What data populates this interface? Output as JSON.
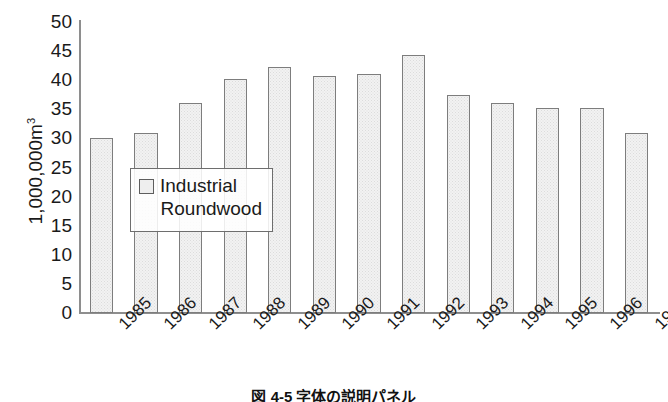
{
  "chart_data": {
    "type": "bar",
    "title": "",
    "xlabel": "",
    "ylabel": "1,000,000m3",
    "ylabel_base": "1,000,000m",
    "ylabel_sup": "3",
    "ylim": [
      0,
      50
    ],
    "ytick_step": 5,
    "grid": false,
    "legend_position": "inside-left",
    "categories": [
      "1985",
      "1986",
      "1987",
      "1988",
      "1989",
      "1990",
      "1991",
      "1992",
      "1993",
      "1994",
      "1995",
      "1996",
      "1997"
    ],
    "yticks": [
      "50",
      "45",
      "40",
      "35",
      "30",
      "25",
      "20",
      "15",
      "10",
      "5",
      "0"
    ],
    "ytick_values": [
      50,
      45,
      40,
      35,
      30,
      25,
      20,
      15,
      10,
      5,
      0
    ],
    "series": [
      {
        "name": "Industrial Roundwood",
        "values": [
          30,
          31,
          36,
          40.2,
          42.2,
          40.7,
          41,
          44.4,
          37.4,
          36,
          35.3,
          35.3,
          31
        ]
      }
    ],
    "legend": [
      {
        "label_line1": "Industrial",
        "label_line2": "Roundwood",
        "swatch_color": "#eeeeee"
      }
    ],
    "colors": {
      "bar_fill": "#f2f2f2",
      "bar_border": "#7d7d7d",
      "axis": "#8e8e8e",
      "text": "#1a1a1a"
    }
  },
  "caption": {
    "text": "図 4-5  字体の説明パネル"
  }
}
